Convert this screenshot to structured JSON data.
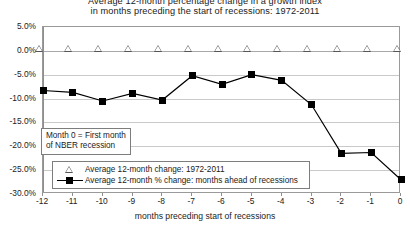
{
  "chart_data": {
    "type": "line",
    "title_line1": "Average 12-month percentage change in a growth index",
    "title_line2": "in months preceding the start of recessions: 1972-2011",
    "xlabel": "months preceding start of recessions",
    "ylabel": "",
    "categories": [
      "-12",
      "-11",
      "-10",
      "-9",
      "-8",
      "-7",
      "-6",
      "-5",
      "-4",
      "-3",
      "-2",
      "-1",
      "0"
    ],
    "x": [
      -12,
      -11,
      -10,
      -9,
      -8,
      -7,
      -6,
      -5,
      -4,
      -3,
      -2,
      -1,
      0
    ],
    "ylim": [
      -30.0,
      5.0
    ],
    "ytick_values": [
      5.0,
      0.0,
      -5.0,
      -10.0,
      -15.0,
      -20.0,
      -25.0,
      -30.0
    ],
    "ytick_labels": [
      "5.0%",
      "0.0%",
      "-5.0%",
      "-10.0%",
      "-15.0%",
      "-20.0%",
      "-25.0%",
      "-30.0%"
    ],
    "grid": true,
    "legend_position": "bottom-left-inside",
    "series": [
      {
        "name": "Average 12-month change: 1972-2011",
        "marker": "open-triangle",
        "line": "none",
        "values": [
          0.0,
          0.0,
          0.0,
          0.0,
          0.0,
          0.0,
          0.0,
          0.0,
          0.0,
          0.0,
          0.0,
          0.0,
          0.0
        ]
      },
      {
        "name": "Average 12-month % change: months ahead of recessions",
        "marker": "filled-square",
        "line": "solid",
        "values": [
          -8.3,
          -8.7,
          -10.5,
          -8.9,
          -10.3,
          -5.2,
          -7.0,
          -5.0,
          -6.2,
          -11.3,
          -21.5,
          -21.3,
          -27.0
        ]
      }
    ],
    "annotation": {
      "line1": "Month 0 = First month",
      "line2": "of NBER recession"
    },
    "colors": {
      "series2_line": "#000000",
      "series2_marker": "#000000",
      "series1_marker_edge": "#555555",
      "gridline": "#c9c9c9",
      "axis": "#8e8e8e",
      "text": "#222222"
    }
  }
}
